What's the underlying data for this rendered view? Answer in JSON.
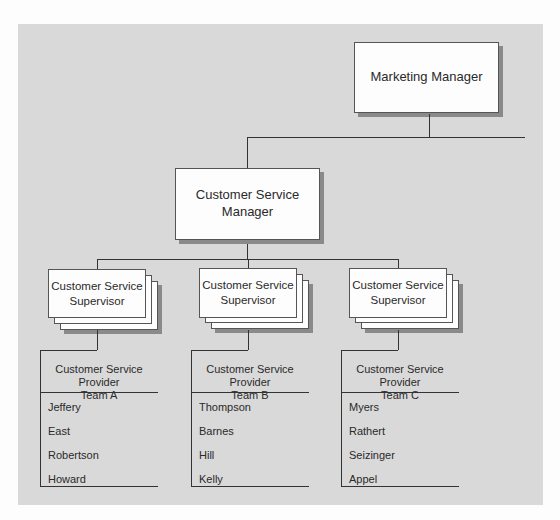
{
  "diagram": {
    "type": "org-chart",
    "top": {
      "title": "Marketing Manager"
    },
    "manager": {
      "title_line1": "Customer Service",
      "title_line2": "Manager"
    },
    "supervisors": [
      {
        "line1": "Customer Service",
        "line2": "Supervisor"
      },
      {
        "line1": "Customer Service",
        "line2": "Supervisor"
      },
      {
        "line1": "Customer Service",
        "line2": "Supervisor"
      }
    ],
    "teams": [
      {
        "line1": "Customer Service Provider",
        "line2": "Team A",
        "members": [
          "Jeffery",
          "East",
          "Robertson",
          "Howard"
        ]
      },
      {
        "line1": "Customer Service Provider",
        "line2": "Team B",
        "members": [
          "Thompson",
          "Barnes",
          "Hill",
          "Kelly"
        ]
      },
      {
        "line1": "Customer Service Provider",
        "line2": "Team C",
        "members": [
          "Myers",
          "Rathert",
          "Seizinger",
          "Appel"
        ]
      }
    ]
  }
}
